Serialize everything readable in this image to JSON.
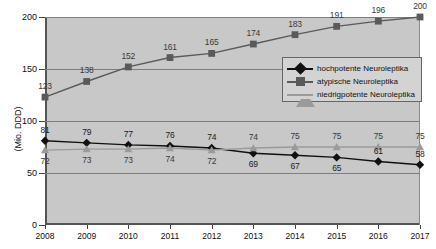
{
  "chart_data": {
    "type": "line",
    "title": "",
    "xlabel": "",
    "ylabel": "(Mio. DDD)",
    "categories": [
      "2008",
      "2009",
      "2010",
      "2011",
      "2012",
      "2013",
      "2014",
      "2015",
      "2016",
      "2017"
    ],
    "ylim": [
      0,
      200
    ],
    "yticks": [
      0,
      50,
      100,
      150,
      200
    ],
    "grid": true,
    "legend_position": "inside-right",
    "series": [
      {
        "name": "hochpotente Neuroleptika",
        "marker": "diamond",
        "color": "#111111",
        "values": [
          81,
          79,
          77,
          76,
          74,
          69,
          67,
          65,
          61,
          58
        ],
        "label_position": [
          "above",
          "above",
          "above",
          "above",
          "above",
          "below",
          "below",
          "below",
          "above",
          "above"
        ]
      },
      {
        "name": "atypische Neuroleptika",
        "marker": "square",
        "color": "#5a5a5a",
        "values": [
          123,
          138,
          152,
          161,
          165,
          174,
          183,
          191,
          196,
          200
        ],
        "label_position": [
          "above",
          "above",
          "above",
          "above",
          "above",
          "above",
          "above",
          "above",
          "above",
          "above"
        ]
      },
      {
        "name": "niedrigpotente Neuroleptika",
        "marker": "triangle",
        "color": "#9a9a9a",
        "values": [
          72,
          73,
          73,
          74,
          72,
          74,
          75,
          75,
          75,
          75
        ],
        "label_position": [
          "below",
          "below",
          "below",
          "below",
          "below",
          "above",
          "above",
          "above",
          "above",
          "above"
        ]
      }
    ]
  },
  "legend": {
    "items": [
      {
        "label": "hochpotente Neuroleptika"
      },
      {
        "label": "atypische Neuroleptika"
      },
      {
        "label": "niedrigpotente Neuroleptika"
      }
    ]
  },
  "axis": {
    "y_title": "(Mio. DDD)",
    "y_ticks": [
      "0",
      "50",
      "100",
      "150",
      "200"
    ],
    "x_ticks": [
      "2008",
      "2009",
      "2010",
      "2011",
      "2012",
      "2013",
      "2014",
      "2015",
      "2016",
      "2017"
    ]
  },
  "colors": {
    "plot_background": "#c8c8c8",
    "page_background": "#ffffff",
    "gridline": "#7e7e7e",
    "series_high": "#111111",
    "series_atyp": "#5a5a5a",
    "series_low": "#9a9a9a"
  }
}
